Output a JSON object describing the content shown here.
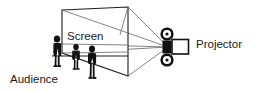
{
  "diagram": {
    "type": "line-art-schematic",
    "background_color": "#ffffff",
    "ink_color": "#1a1a1a",
    "ray_color": "#6e6e6e",
    "canvas": {
      "width": 266,
      "height": 92
    },
    "labels": {
      "screen": "Screen",
      "audience": "Audience",
      "projector": "Projector"
    },
    "label_positions": {
      "screen": {
        "x": 67,
        "y": 40
      },
      "audience": {
        "x": 10,
        "y": 82
      },
      "projector": {
        "x": 196,
        "y": 47
      }
    },
    "screen_surface": {
      "description": "rectangular projection screen drawn in perspective",
      "corners": [
        {
          "x": 62,
          "y": 10
        },
        {
          "x": 128,
          "y": 7
        },
        {
          "x": 128,
          "y": 76
        },
        {
          "x": 62,
          "y": 53
        }
      ]
    },
    "light_rays": {
      "origin": {
        "x": 168,
        "y": 47
      },
      "targets": [
        {
          "x": 62,
          "y": 10
        },
        {
          "x": 128,
          "y": 7
        },
        {
          "x": 128,
          "y": 76
        },
        {
          "x": 62,
          "y": 53
        },
        {
          "x": 62,
          "y": 44
        }
      ],
      "count": 5
    },
    "projector": {
      "center": {
        "x": 168,
        "y": 47
      },
      "reels": [
        {
          "cx": 167,
          "cy": 34,
          "r": 6.5
        },
        {
          "cx": 167,
          "cy": 60,
          "r": 6.5
        }
      ],
      "lens_block": {
        "x": 163,
        "y": 41,
        "width": 9,
        "height": 12
      },
      "housing": {
        "x": 172,
        "y": 40,
        "width": 16,
        "height": 14
      }
    },
    "audience_figures": [
      {
        "id": "figure-tall-left",
        "x": 52,
        "y": 37,
        "height": 30
      },
      {
        "id": "figure-short-mid",
        "x": 70,
        "y": 44,
        "height": 26
      },
      {
        "id": "figure-front-right",
        "x": 85,
        "y": 47,
        "height": 33
      }
    ],
    "ground_line": {
      "x1": 52,
      "y1": 56,
      "x2": 128,
      "y2": 56
    }
  }
}
